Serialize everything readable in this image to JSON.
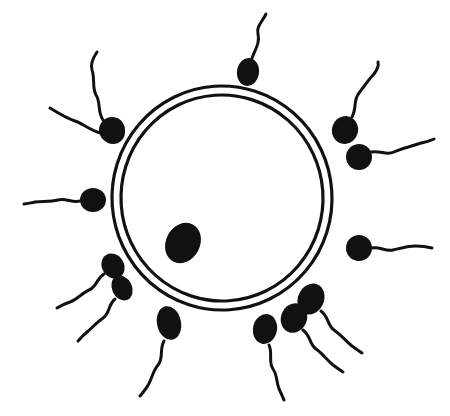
{
  "canvas": {
    "width": 450,
    "height": 416,
    "background_color": "#ffffff",
    "ink_color": "#111111"
  },
  "figure": {
    "style": "hand-drawn black ink line illustration",
    "subject_count_sperm": 12,
    "subject_count_ovum": 1
  },
  "ovum": {
    "name": "ovum",
    "center_x": 222,
    "center_y": 198,
    "outer_radius_x": 110,
    "outer_radius_y": 112,
    "inner_radius_x": 101,
    "inner_radius_y": 103,
    "membrane_stroke_width": 3.2,
    "membrane_color": "#111111",
    "fill_color": "#ffffff",
    "rotation_deg": -4
  },
  "nucleus": {
    "name": "nucleus",
    "center_x": 183,
    "center_y": 243,
    "radius_x": 17,
    "radius_y": 21,
    "rotation_deg": 28,
    "fill_color": "#111111"
  },
  "sperm_cells": [
    {
      "id": "sperm-top",
      "position_label": "top",
      "head_x": 248,
      "head_y": 72,
      "head_rx": 11,
      "head_ry": 14,
      "head_rotation_deg": 8,
      "tail_path": "M 252 58 C 256 48 260 42 258 34 C 256 27 262 22 266 14",
      "tail_width": 3.0
    },
    {
      "id": "sperm-upper-left-outer",
      "position_label": "upper-left-outer",
      "head_x": 112,
      "head_y": 130,
      "head_rx": 13,
      "head_ry": 13,
      "head_rotation_deg": -25,
      "tail_path": "M 103 120 C 97 111 101 102 96 95 C 92 88 95 78 92 70 C 90 64 93 58 97 52",
      "tail_width": 3.0
    },
    {
      "id": "sperm-upper-left-inner",
      "position_label": "upper-left-inner",
      "head_x": 113,
      "head_y": 132,
      "head_rx": 12,
      "head_ry": 12,
      "head_rotation_deg": 0,
      "tail_path": "M 101 133 C 91 131 84 124 75 121 C 66 118 58 113 50 108",
      "tail_width": 3.0
    },
    {
      "id": "sperm-upper-right-outer",
      "position_label": "upper-right-outer",
      "head_x": 345,
      "head_y": 130,
      "head_rx": 13,
      "head_ry": 14,
      "head_rotation_deg": 18,
      "tail_path": "M 352 117 C 357 108 353 100 359 93 C 364 87 368 80 374 74 C 377 70 379 66 378 62",
      "tail_width": 3.0
    },
    {
      "id": "sperm-right-upper",
      "position_label": "right-upper",
      "head_x": 359,
      "head_y": 157,
      "head_rx": 13,
      "head_ry": 13,
      "head_rotation_deg": -10,
      "tail_path": "M 371 152 C 381 150 386 156 394 152 C 402 148 410 147 418 144 C 425 142 430 141 434 139",
      "tail_width": 3.0
    },
    {
      "id": "sperm-right-middle",
      "position_label": "right-middle",
      "head_x": 359,
      "head_y": 248,
      "head_rx": 13,
      "head_ry": 13,
      "head_rotation_deg": 0,
      "tail_path": "M 372 248 C 380 246 385 252 393 250 C 401 248 408 246 416 246 C 423 246 428 247 432 248",
      "tail_width": 3.0
    },
    {
      "id": "sperm-left-middle",
      "position_label": "left-middle",
      "head_x": 93,
      "head_y": 200,
      "head_rx": 13,
      "head_ry": 12,
      "head_rotation_deg": 0,
      "tail_path": "M 80 201 C 72 203 66 198 58 200 C 50 202 42 201 35 202 C 30 203 27 204 24 204",
      "tail_width": 3.0
    },
    {
      "id": "sperm-lower-left-upper",
      "position_label": "lower-left-upper",
      "head_x": 113,
      "head_y": 266,
      "head_rx": 11,
      "head_ry": 13,
      "head_rotation_deg": -32,
      "tail_path": "M 104 274 C 96 279 97 287 89 290 C 82 293 78 299 70 302 C 64 304 60 306 57 308",
      "tail_width": 3.0
    },
    {
      "id": "sperm-lower-left-lower",
      "position_label": "lower-left-lower",
      "head_x": 122,
      "head_y": 288,
      "head_rx": 10,
      "head_ry": 13,
      "head_rotation_deg": -26,
      "tail_path": "M 115 299 C 108 305 110 313 103 318 C 96 323 92 328 86 333 C 82 336 80 339 78 341",
      "tail_width": 3.0
    },
    {
      "id": "sperm-bottom-left",
      "position_label": "bottom-left",
      "head_x": 169,
      "head_y": 323,
      "head_rx": 12,
      "head_ry": 17,
      "head_rotation_deg": -12,
      "tail_path": "M 164 341 C 159 350 164 358 158 365 C 152 372 152 380 147 387 C 144 391 142 394 140 396",
      "tail_width": 3.0
    },
    {
      "id": "sperm-bottom-center",
      "position_label": "bottom-center",
      "head_x": 265,
      "head_y": 329,
      "head_rx": 12,
      "head_ry": 15,
      "head_rotation_deg": 12,
      "tail_path": "M 269 345 C 273 354 268 362 273 369 C 278 376 276 384 280 391 C 282 395 283 398 284 400",
      "tail_width": 3.0
    },
    {
      "id": "sperm-bottom-right-inner",
      "position_label": "bottom-right-inner",
      "head_x": 294,
      "head_y": 318,
      "head_rx": 13,
      "head_ry": 15,
      "head_rotation_deg": 22,
      "tail_path": "M 303 330 C 311 336 309 344 316 349 C 323 354 327 360 333 365 C 337 368 340 370 343 372",
      "tail_width": 3.0
    },
    {
      "id": "sperm-bottom-right-outer",
      "position_label": "bottom-right-outer",
      "head_x": 311,
      "head_y": 299,
      "head_rx": 13,
      "head_ry": 16,
      "head_rotation_deg": 24,
      "tail_path": "M 321 311 C 329 317 327 325 334 330 C 341 335 346 341 352 346 C 356 349 359 351 362 353",
      "tail_width": 3.0
    }
  ]
}
